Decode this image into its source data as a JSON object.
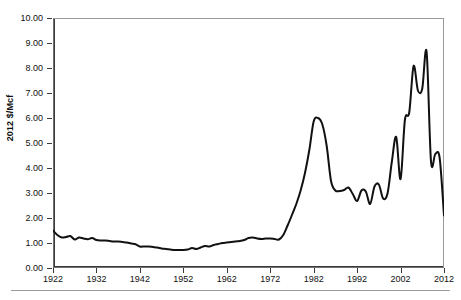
{
  "chart_data": {
    "type": "line",
    "title": "",
    "xlabel": "",
    "ylabel": "2012 $/Mcf",
    "xlim": [
      1922,
      2012
    ],
    "ylim": [
      0.0,
      10.0
    ],
    "grid": false,
    "legend": null,
    "y_tick_labels": [
      "10.00",
      "9.00",
      "8.00",
      "7.00",
      "6.00",
      "5.00",
      "4.00",
      "3.00",
      "2.00",
      "1.00",
      "0.00"
    ],
    "y_tick_values": [
      10,
      9,
      8,
      7,
      6,
      5,
      4,
      3,
      2,
      1,
      0
    ],
    "x_tick_labels": [
      "1922",
      "1932",
      "1942",
      "1952",
      "1962",
      "1972",
      "1982",
      "1992",
      "2002",
      "2012"
    ],
    "x_tick_values": [
      1922,
      1932,
      1942,
      1952,
      1962,
      1972,
      1982,
      1992,
      2002,
      2012
    ],
    "series": [
      {
        "name": "Natural gas wellhead price (real 2012 dollars)",
        "color": "#111111",
        "x": [
          1922,
          1923,
          1924,
          1925,
          1926,
          1927,
          1928,
          1929,
          1930,
          1931,
          1932,
          1933,
          1934,
          1935,
          1936,
          1937,
          1938,
          1939,
          1940,
          1941,
          1942,
          1943,
          1944,
          1945,
          1946,
          1947,
          1948,
          1949,
          1950,
          1951,
          1952,
          1953,
          1954,
          1955,
          1956,
          1957,
          1958,
          1959,
          1960,
          1961,
          1962,
          1963,
          1964,
          1965,
          1966,
          1967,
          1968,
          1969,
          1970,
          1971,
          1972,
          1973,
          1974,
          1975,
          1976,
          1977,
          1978,
          1979,
          1980,
          1981,
          1982,
          1983,
          1984,
          1985,
          1986,
          1987,
          1988,
          1989,
          1990,
          1991,
          1992,
          1993,
          1994,
          1995,
          1996,
          1997,
          1998,
          1999,
          2000,
          2001,
          2002,
          2003,
          2004,
          2005,
          2006,
          2007,
          2008,
          2009,
          2010,
          2011,
          2012
        ],
        "values": [
          1.5,
          1.32,
          1.22,
          1.24,
          1.28,
          1.14,
          1.22,
          1.18,
          1.15,
          1.2,
          1.12,
          1.1,
          1.1,
          1.08,
          1.06,
          1.06,
          1.04,
          1.02,
          0.98,
          0.95,
          0.86,
          0.86,
          0.86,
          0.84,
          0.82,
          0.78,
          0.76,
          0.74,
          0.72,
          0.72,
          0.72,
          0.74,
          0.8,
          0.76,
          0.82,
          0.88,
          0.86,
          0.92,
          0.96,
          1.0,
          1.02,
          1.04,
          1.06,
          1.08,
          1.12,
          1.2,
          1.22,
          1.18,
          1.16,
          1.18,
          1.18,
          1.16,
          1.14,
          1.32,
          1.7,
          2.12,
          2.56,
          3.1,
          3.8,
          4.72,
          5.86,
          6.0,
          5.74,
          4.88,
          3.48,
          3.1,
          3.08,
          3.12,
          3.22,
          2.96,
          2.68,
          3.1,
          3.06,
          2.56,
          3.26,
          3.34,
          2.78,
          2.98,
          4.26,
          5.24,
          3.56,
          5.92,
          6.22,
          8.08,
          7.1,
          7.18,
          8.64,
          4.28,
          4.56,
          4.4,
          2.1
        ]
      }
    ]
  },
  "axes": {
    "y_axis_title": "2012 $/Mcf"
  }
}
